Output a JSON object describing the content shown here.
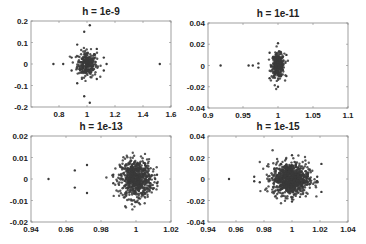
{
  "chart_data": [
    {
      "type": "scatter",
      "title": "h = 1e-9",
      "xlabel": "",
      "ylabel": "",
      "xlim": [
        0.6,
        1.6
      ],
      "ylim": [
        -0.2,
        0.2
      ],
      "xticks": [
        0.8,
        1,
        1.2,
        1.4,
        1.6
      ],
      "xtick_labels": [
        "0.8",
        "1",
        "1.2",
        "1.4",
        "1.6"
      ],
      "yticks": [
        -0.2,
        -0.1,
        0,
        0.1,
        0.2
      ],
      "ytick_labels": [
        "-0.2",
        "-0.1",
        "0",
        "0.1",
        "0.2"
      ],
      "grid": false,
      "cluster": {
        "center": [
          1.0,
          0.0
        ],
        "sx": 0.035,
        "sy": 0.03,
        "n": 260
      },
      "outliers": [
        [
          0.76,
          0
        ],
        [
          0.83,
          0
        ],
        [
          1.52,
          0
        ],
        [
          1.02,
          0.18
        ],
        [
          1.02,
          -0.18
        ],
        [
          0.98,
          0.15
        ],
        [
          0.98,
          -0.15
        ],
        [
          0.93,
          0.09
        ],
        [
          0.93,
          -0.09
        ],
        [
          1.07,
          0.07
        ],
        [
          1.07,
          -0.07
        ],
        [
          1.12,
          0.03
        ],
        [
          1.12,
          -0.03
        ],
        [
          1.14,
          0
        ],
        [
          0.89,
          0.03
        ],
        [
          0.89,
          -0.03
        ]
      ],
      "box_px": {
        "x": 31,
        "y": 21,
        "w": 140,
        "h": 86
      }
    },
    {
      "type": "scatter",
      "title": "h = 1e-11",
      "xlabel": "",
      "ylabel": "",
      "xlim": [
        0.9,
        1.1
      ],
      "ylim": [
        -0.04,
        0.04
      ],
      "xticks": [
        0.9,
        0.95,
        1,
        1.05,
        1.1
      ],
      "xtick_labels": [
        "0.9",
        "0.95",
        "1",
        "1.05",
        "1.1"
      ],
      "yticks": [
        -0.04,
        -0.02,
        0,
        0.02,
        0.04
      ],
      "ytick_labels": [
        "-0.04",
        "-0.02",
        "0",
        "0.02",
        "0.04"
      ],
      "grid": false,
      "cluster": {
        "center": [
          1.0,
          0.0
        ],
        "sx": 0.0045,
        "sy": 0.0055,
        "n": 320
      },
      "outliers": [
        [
          0.918,
          0
        ],
        [
          0.958,
          0
        ],
        [
          0.964,
          0
        ],
        [
          0.972,
          0.002
        ],
        [
          0.972,
          -0.002
        ],
        [
          1.0,
          0.021
        ],
        [
          1.0,
          -0.02
        ],
        [
          0.988,
          0.012
        ],
        [
          0.988,
          -0.012
        ],
        [
          1.012,
          0.01
        ],
        [
          1.012,
          -0.01
        ]
      ],
      "box_px": {
        "x": 208,
        "y": 23,
        "w": 140,
        "h": 85
      }
    },
    {
      "type": "scatter",
      "title": "h = 1e-13",
      "xlabel": "",
      "ylabel": "",
      "xlim": [
        0.94,
        1.02
      ],
      "ylim": [
        -0.02,
        0.02
      ],
      "xticks": [
        0.94,
        0.96,
        0.98,
        1,
        1.02
      ],
      "xtick_labels": [
        "0.94",
        "0.96",
        "0.98",
        "1",
        "1.02"
      ],
      "yticks": [
        -0.02,
        -0.01,
        0,
        0.01,
        0.02
      ],
      "ytick_labels": [
        "-0.02",
        "-0.01",
        "0",
        "0.01",
        "0.02"
      ],
      "grid": false,
      "cluster": {
        "center": [
          1.0,
          0.0
        ],
        "sx": 0.0045,
        "sy": 0.0045,
        "n": 700
      },
      "outliers": [
        [
          0.95,
          0
        ],
        [
          0.965,
          0.004
        ],
        [
          0.965,
          -0.004
        ],
        [
          0.972,
          0.0065
        ],
        [
          0.972,
          -0.0065
        ],
        [
          1.012,
          0.002
        ],
        [
          1.012,
          -0.002
        ],
        [
          1.011,
          0.0
        ],
        [
          0.987,
          0.002
        ],
        [
          0.987,
          -0.002
        ]
      ],
      "box_px": {
        "x": 31,
        "y": 136,
        "w": 140,
        "h": 86
      }
    },
    {
      "type": "scatter",
      "title": "h = 1e-15",
      "xlabel": "",
      "ylabel": "",
      "xlim": [
        0.94,
        1.04
      ],
      "ylim": [
        -0.04,
        0.04
      ],
      "xticks": [
        0.94,
        0.96,
        0.98,
        1,
        1.02,
        1.04
      ],
      "xtick_labels": [
        "0.94",
        "0.96",
        "0.98",
        "1",
        "1.02",
        "1.04"
      ],
      "yticks": [
        -0.04,
        -0.02,
        0,
        0.02,
        0.04
      ],
      "ytick_labels": [
        "-0.04",
        "-0.02",
        "0",
        "0.02",
        "0.04"
      ],
      "grid": false,
      "cluster": {
        "center": [
          0.999,
          0.0
        ],
        "sx": 0.0065,
        "sy": 0.0075,
        "n": 900
      },
      "outliers": [
        [
          0.955,
          0
        ],
        [
          0.973,
          0.002
        ],
        [
          0.973,
          -0.002
        ],
        [
          0.977,
          -0.003
        ],
        [
          1.021,
          0.014
        ],
        [
          1.021,
          -0.012
        ],
        [
          1.0,
          0.022
        ],
        [
          1.0,
          -0.021
        ],
        [
          1.018,
          0.002
        ],
        [
          1.018,
          -0.002
        ]
      ],
      "box_px": {
        "x": 208,
        "y": 136,
        "w": 140,
        "h": 86
      }
    }
  ],
  "style": {
    "marker_color": "#3a3a3a",
    "axis_color": "#888888",
    "text_color": "#222222"
  }
}
